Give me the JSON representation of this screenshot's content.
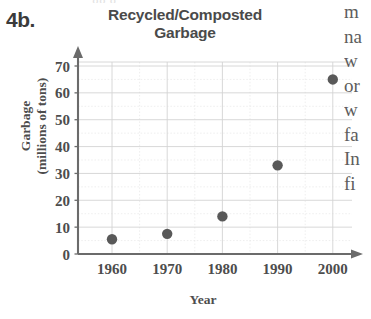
{
  "problem": {
    "number": "4b."
  },
  "top_cutoff_text": "gg  g  , ,",
  "chart_data": {
    "type": "scatter",
    "title": "Recycled/Composted Garbage",
    "xlabel": "Year",
    "ylabel": "Garbage (millions of tons)",
    "ylabel_line1": "Garbage",
    "ylabel_line2": "(millions of tons)",
    "title_line1": "Recycled/Composted",
    "title_line2": "Garbage",
    "x": [
      1960,
      1970,
      1980,
      1990,
      2000
    ],
    "values": [
      5.5,
      7.5,
      14,
      33,
      65
    ],
    "categories": [
      "1960",
      "1970",
      "1980",
      "1990",
      "2000"
    ],
    "xtick_labels": [
      "1960",
      "1970",
      "1980",
      "1990",
      "2000"
    ],
    "ytick_labels": [
      "0",
      "10",
      "20",
      "30",
      "40",
      "50",
      "60",
      "70"
    ],
    "ytick_values": [
      0,
      10,
      20,
      30,
      40,
      50,
      60,
      70
    ],
    "xlim": [
      1955,
      2005
    ],
    "ylim": [
      0,
      72
    ],
    "grid": true,
    "legend": false,
    "marker_color": "#595959",
    "axis_color": "#6b6b6b",
    "grid_color": "#d4d4d4",
    "minor_grid_color": "#e6e6e6"
  },
  "body_text_fragments": [
    "m",
    "na",
    "w",
    "or",
    "w",
    "fa",
    "In",
    "fi"
  ]
}
